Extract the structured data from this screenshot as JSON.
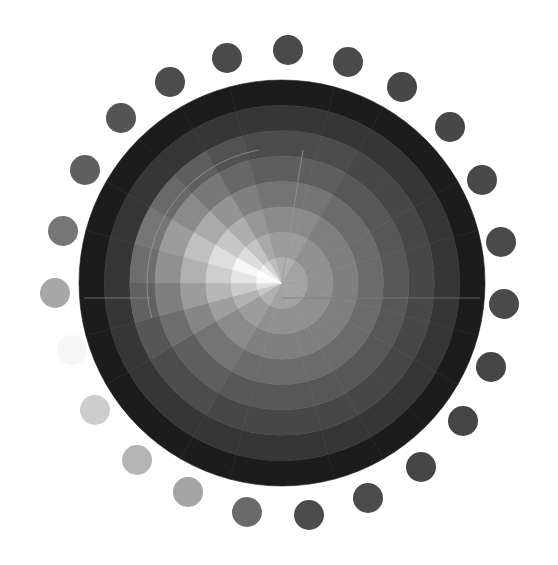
{
  "title": "Grayscale segmented color wheel",
  "wheel": {
    "cx": 282,
    "cy": 283,
    "outer_radius": 203,
    "ring_count": 8,
    "segment_count": 24,
    "segment_degrees": 15,
    "ring_grays_right_half": [
      "#a2a2a2",
      "#909090",
      "#7f7f7f",
      "#6b6b6b",
      "#575757",
      "#474747",
      "#363636",
      "#1c1c1c"
    ],
    "highlight_angle_deg": 200,
    "highlight_spread_deg": 55,
    "highlight_max_radius_ring": 5,
    "divider_lines": [
      {
        "from": [
          282,
          283
        ],
        "to": [
          303,
          150
        ],
        "color": "#9a9a9a"
      },
      {
        "from": [
          282,
          298
        ],
        "to": [
          480,
          298
        ],
        "color": "#7a7a7a"
      },
      {
        "from": [
          84,
          298
        ],
        "to": [
          150,
          298
        ],
        "color": "#8a8a8a"
      }
    ],
    "inner_arc": {
      "radius": 135,
      "start_deg": 165,
      "end_deg": 260,
      "color": "#a8a8a8"
    }
  },
  "dots": [
    {
      "x": 288,
      "y": 50,
      "r": 15,
      "color": "#4a4a4a"
    },
    {
      "x": 348,
      "y": 62,
      "r": 15,
      "color": "#4a4a4a"
    },
    {
      "x": 402,
      "y": 87,
      "r": 15,
      "color": "#474747"
    },
    {
      "x": 450,
      "y": 127,
      "r": 15,
      "color": "#474747"
    },
    {
      "x": 482,
      "y": 180,
      "r": 15,
      "color": "#484848"
    },
    {
      "x": 501,
      "y": 242,
      "r": 15,
      "color": "#4a4a4a"
    },
    {
      "x": 504,
      "y": 304,
      "r": 15,
      "color": "#4a4a4a"
    },
    {
      "x": 491,
      "y": 367,
      "r": 15,
      "color": "#454545"
    },
    {
      "x": 463,
      "y": 421,
      "r": 15,
      "color": "#454545"
    },
    {
      "x": 421,
      "y": 467,
      "r": 15,
      "color": "#464646"
    },
    {
      "x": 368,
      "y": 498,
      "r": 15,
      "color": "#4c4c4c"
    },
    {
      "x": 309,
      "y": 515,
      "r": 15,
      "color": "#4c4c4c"
    },
    {
      "x": 247,
      "y": 512,
      "r": 15,
      "color": "#6a6a6a"
    },
    {
      "x": 188,
      "y": 492,
      "r": 15,
      "color": "#a3a3a3"
    },
    {
      "x": 137,
      "y": 460,
      "r": 15,
      "color": "#b4b4b4"
    },
    {
      "x": 95,
      "y": 410,
      "r": 15,
      "color": "#cdcdcd"
    },
    {
      "x": 72,
      "y": 350,
      "r": 15,
      "color": "#f6f6f6"
    },
    {
      "x": 55,
      "y": 293,
      "r": 15,
      "color": "#a7a7a7"
    },
    {
      "x": 63,
      "y": 231,
      "r": 15,
      "color": "#767676"
    },
    {
      "x": 85,
      "y": 170,
      "r": 15,
      "color": "#5f5f5f"
    },
    {
      "x": 121,
      "y": 118,
      "r": 15,
      "color": "#555555"
    },
    {
      "x": 170,
      "y": 82,
      "r": 15,
      "color": "#4d4d4d"
    },
    {
      "x": 227,
      "y": 58,
      "r": 15,
      "color": "#4a4a4a"
    }
  ]
}
